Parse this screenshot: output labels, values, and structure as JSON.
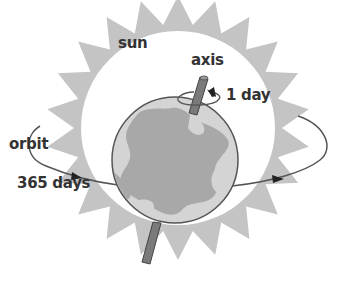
{
  "diagram": {
    "labels": {
      "sun": "sun",
      "axis": "axis",
      "rotation_period": "1 day",
      "orbit": "orbit",
      "orbit_period": "365 days"
    },
    "colors": {
      "sun_rays": "#c4c4c4",
      "sun_disc": "#ffffff",
      "earth_ocean": "#a8a8a8",
      "earth_land": "#d4d4d4",
      "earth_outline": "#555555",
      "axis_rod": "#7a7a7a",
      "orbit_line": "#555555",
      "text": "#333333"
    }
  }
}
